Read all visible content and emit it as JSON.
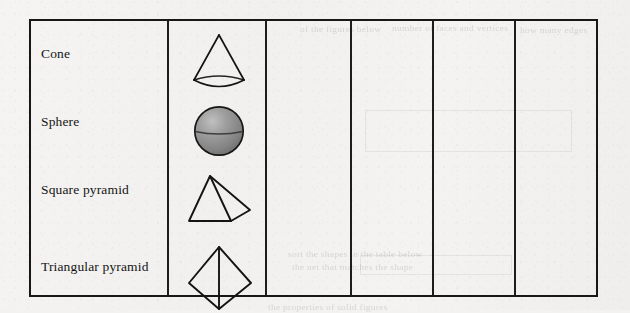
{
  "page": {
    "background_color": "#f3f2f0",
    "ink_color": "#171717"
  },
  "table": {
    "name": "3d-shapes-table",
    "border_color": "#171717",
    "column_count": 6,
    "row_count": 4,
    "has_horizontal_rules": false,
    "column_divider_x": [
      167,
      265,
      350,
      432,
      514
    ],
    "bounds": {
      "left": 29,
      "top": 19,
      "width": 569,
      "height": 278
    },
    "columns": [
      {
        "name": "shape-name-column",
        "filled": true
      },
      {
        "name": "shape-picture-column",
        "filled": true
      },
      {
        "name": "blank-column-1",
        "filled": false
      },
      {
        "name": "blank-column-2",
        "filled": false
      },
      {
        "name": "blank-column-3",
        "filled": false
      },
      {
        "name": "blank-column-4",
        "filled": false
      }
    ],
    "rows": [
      {
        "label": "Cone",
        "shape": "cone",
        "label_y": 52,
        "shape_y": 53
      },
      {
        "label": "Sphere",
        "shape": "sphere",
        "label_y": 120,
        "shape_y": 121
      },
      {
        "label": "Square pyramid",
        "shape": "square-pyramid",
        "label_y": 188,
        "shape_y": 188
      },
      {
        "label": "Triangular pyramid",
        "shape": "triangular-pyramid",
        "label_y": 265,
        "shape_y": 262
      }
    ]
  },
  "shapes": {
    "cone": {
      "name": "cone-figure",
      "style": "outline",
      "stroke": "#141414",
      "fill": "none"
    },
    "sphere": {
      "name": "sphere-figure",
      "style": "shaded",
      "stroke": "#141414",
      "fill_light": "#b4b4b4",
      "fill_mid": "#8e8e8e",
      "fill_dark": "#6e6e6e",
      "has_equator_line": true
    },
    "square_pyramid": {
      "name": "square-pyramid-figure",
      "style": "outline",
      "stroke": "#141414",
      "fill": "none",
      "visible_faces": 2
    },
    "triangular_pyramid": {
      "name": "triangular-pyramid-figure",
      "style": "outline",
      "stroke": "#141414",
      "fill": "none",
      "visible_faces": 2
    }
  },
  "bleed_through": {
    "note": "faint mirrored text showing through from the reverse side of the scanned page",
    "lines": [
      {
        "text": "of the figures below",
        "x": 300,
        "y": 24
      },
      {
        "text": "number of faces and vertices",
        "x": 392,
        "y": 23
      },
      {
        "text": "how many edges",
        "x": 520,
        "y": 25
      },
      {
        "text": "sort the shapes in the table below",
        "x": 288,
        "y": 249
      },
      {
        "text": "the net that matches the shape",
        "x": 292,
        "y": 262
      },
      {
        "text": "the properties of solid figures",
        "x": 268,
        "y": 302
      }
    ]
  }
}
